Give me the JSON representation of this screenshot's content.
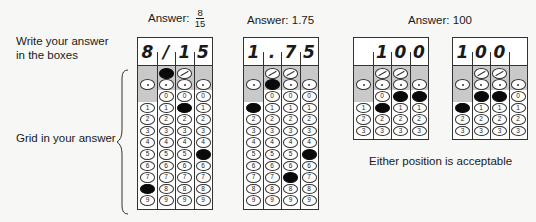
{
  "instructions": {
    "write_label_line1": "Write your answer",
    "write_label_line2": "in the boxes",
    "grid_label": "Grid in your answer",
    "footer_note": "Either position is acceptable"
  },
  "examples": [
    {
      "title_prefix": "Answer:",
      "title_fraction": {
        "numerator": "8",
        "denominator": "15"
      },
      "written": [
        "8",
        "/",
        "1",
        "5"
      ],
      "filled": [
        "8",
        "/",
        "1",
        "5"
      ]
    },
    {
      "title": "Answer: 1.75",
      "written": [
        "1",
        ".",
        "7",
        "5"
      ],
      "filled": [
        "1",
        ".",
        "7",
        "5"
      ]
    },
    {
      "title": "Answer: 100",
      "variants": [
        {
          "written": [
            "",
            "1",
            "0",
            "0"
          ],
          "filled": [
            "",
            "1",
            "0",
            "0"
          ]
        },
        {
          "written": [
            "1",
            "0",
            "0",
            ""
          ],
          "filled": [
            "1",
            "0",
            "0",
            ""
          ]
        }
      ]
    }
  ],
  "bubble_labels": {
    "slash": "/",
    "decimal": ".",
    "digits": [
      "0",
      "1",
      "2",
      "3",
      "4",
      "5",
      "6",
      "7",
      "8",
      "9"
    ]
  }
}
